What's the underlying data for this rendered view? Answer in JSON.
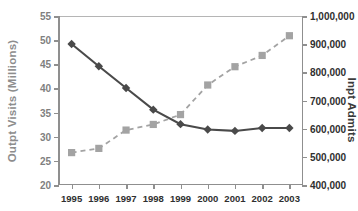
{
  "chart_data": {
    "type": "line",
    "title": "",
    "xlabel": "",
    "categories": [
      "1995",
      "1996",
      "1997",
      "1998",
      "1999",
      "2000",
      "2001",
      "2002",
      "2003"
    ],
    "grid": false,
    "legend": "none",
    "axes": {
      "left": {
        "label": "Outpt Visits (Millions)",
        "ylim": [
          20,
          55
        ],
        "step": 5,
        "ticks": [
          "20",
          "25",
          "30",
          "35",
          "40",
          "45",
          "50",
          "55"
        ],
        "tick_values": [
          20,
          25,
          30,
          35,
          40,
          45,
          50,
          55
        ],
        "color": "#7f7f7f"
      },
      "right": {
        "label": "Inpt Admits",
        "ylim": [
          400000,
          1000000
        ],
        "step": 100000,
        "ticks": [
          "400,000",
          "500,000",
          "600,000",
          "700,000",
          "800,000",
          "900,000",
          "1,000,000"
        ],
        "tick_values": [
          400000,
          500000,
          600000,
          700000,
          800000,
          900000,
          1000000
        ],
        "color": "#2f2f2f"
      }
    },
    "series": [
      {
        "name": "Outpt Visits (Millions)",
        "axis": "left",
        "marker": "diamond",
        "line_style": "solid",
        "color": "#4a4a4a",
        "values": [
          49.2,
          44.6,
          40.1,
          35.6,
          32.6,
          31.5,
          31.2,
          31.8,
          31.8
        ]
      },
      {
        "name": "Inpt Admits",
        "axis": "right",
        "marker": "square",
        "line_style": "dashed",
        "color": "#a3a3a3",
        "values": [
          515000,
          530000,
          595000,
          615000,
          650000,
          755000,
          820000,
          860000,
          930000
        ]
      }
    ]
  }
}
